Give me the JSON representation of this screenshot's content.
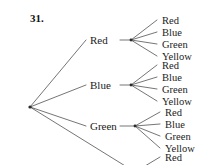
{
  "page": {
    "background_color": "#ffffff",
    "ink_color": "#333333",
    "width": 208,
    "height": 165
  },
  "problem": {
    "number": "31."
  },
  "diagram": {
    "type": "probability-tree-diagram",
    "root": {
      "x": 30,
      "y": 107
    },
    "level1": [
      {
        "label": "Red",
        "label_x": 90,
        "label_y": 35,
        "fan_x": 131,
        "fan_y": 40,
        "leaves": [
          {
            "label": "Red",
            "x": 162,
            "y": 16,
            "line_x": 157,
            "line_y": 20
          },
          {
            "label": "Blue",
            "x": 162,
            "y": 28,
            "line_x": 157,
            "line_y": 32
          },
          {
            "label": "Green",
            "x": 162,
            "y": 40,
            "line_x": 157,
            "line_y": 44
          },
          {
            "label": "Yellow",
            "x": 162,
            "y": 52,
            "line_x": 157,
            "line_y": 56
          }
        ]
      },
      {
        "label": "Blue",
        "label_x": 90,
        "label_y": 80,
        "fan_x": 131,
        "fan_y": 85,
        "leaves": [
          {
            "label": "Red",
            "x": 162,
            "y": 61,
            "line_x": 157,
            "line_y": 65
          },
          {
            "label": "Blue",
            "x": 162,
            "y": 73,
            "line_x": 157,
            "line_y": 77
          },
          {
            "label": "Green",
            "x": 162,
            "y": 85,
            "line_x": 157,
            "line_y": 89
          },
          {
            "label": "Yellow",
            "x": 162,
            "y": 97,
            "line_x": 157,
            "line_y": 101
          }
        ]
      },
      {
        "label": "Green",
        "label_x": 90,
        "label_y": 121,
        "fan_x": 135,
        "fan_y": 126,
        "leaves": [
          {
            "label": "Red",
            "x": 165,
            "y": 108,
            "line_x": 160,
            "line_y": 112
          },
          {
            "label": "Blue",
            "x": 165,
            "y": 120,
            "line_x": 160,
            "line_y": 124
          },
          {
            "label": "Green",
            "x": 165,
            "y": 132,
            "line_x": 160,
            "line_y": 136
          },
          {
            "label": "Yellow",
            "x": 165,
            "y": 144,
            "line_x": 160,
            "line_y": 148
          }
        ]
      },
      {
        "label": "",
        "label_x": 90,
        "label_y": 170,
        "fan_x": 135,
        "fan_y": 172,
        "leaves": [
          {
            "label": "Red",
            "x": 165,
            "y": 153,
            "line_x": 160,
            "line_y": 157
          }
        ]
      }
    ]
  }
}
